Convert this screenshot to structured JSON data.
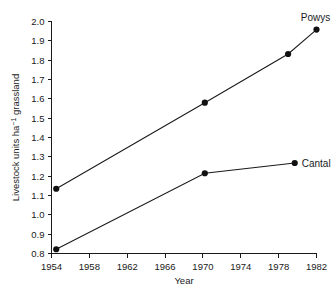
{
  "chart_data": {
    "type": "line",
    "title": "",
    "xlabel": "Year",
    "ylabel_parts": {
      "pre": "Livestock units ha",
      "sup": "−1",
      "post": " grassland"
    },
    "ylabel": "Livestock units ha−1 grassland",
    "xlim": [
      1954,
      1982
    ],
    "ylim": [
      0.8,
      2.0
    ],
    "xticks": [
      1954,
      1958,
      1962,
      1966,
      1970,
      1974,
      1978,
      1982
    ],
    "xtick_labels": [
      "1954",
      "1958",
      "1962",
      "1966",
      "1970",
      "1974",
      "1978",
      "1982"
    ],
    "yticks": [
      0.8,
      0.9,
      1.0,
      1.1,
      1.2,
      1.3,
      1.4,
      1.5,
      1.6,
      1.7,
      1.8,
      1.9,
      2.0
    ],
    "ytick_labels": [
      "0.8",
      "0.9",
      "1.0",
      "1.1",
      "1.2",
      "1.3",
      "1.4",
      "1.5",
      "1.6",
      "1.7",
      "1.8",
      "1.9",
      "2.0"
    ],
    "grid": false,
    "legend_position": "inline-end-of-line",
    "marker": "filled-circle",
    "line_color": "#1a1a1a",
    "marker_color": "#111111",
    "series": [
      {
        "name": "Powys",
        "label": "Powys",
        "label_anchor": "above-last-point",
        "x": [
          1954.5,
          1970.2,
          1979.0,
          1982.0
        ],
        "y": [
          1.135,
          1.58,
          1.832,
          1.958
        ]
      },
      {
        "name": "Cantal",
        "label": "Cantal",
        "label_anchor": "right-of-last-point",
        "x": [
          1954.5,
          1970.2,
          1979.7
        ],
        "y": [
          0.822,
          1.215,
          1.268
        ]
      }
    ]
  }
}
